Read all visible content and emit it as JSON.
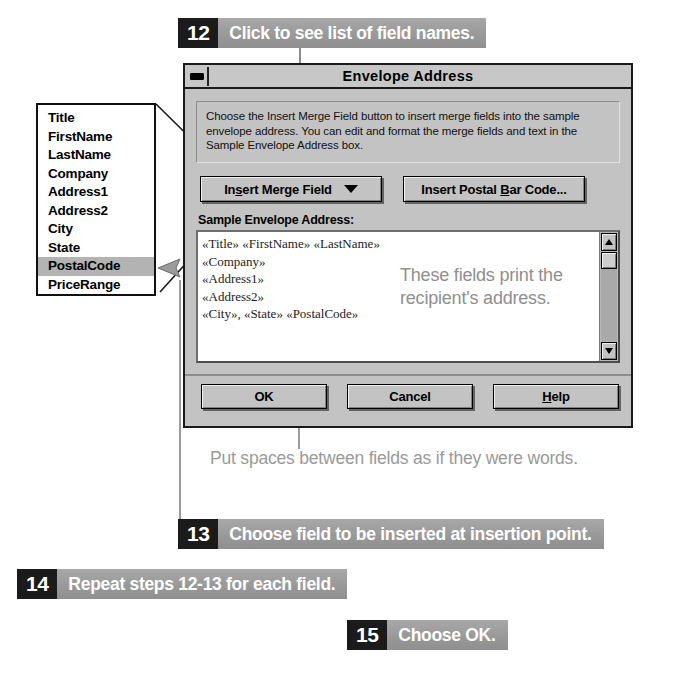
{
  "steps": [
    {
      "number": "12",
      "text": "Click to see list of field names."
    },
    {
      "number": "13",
      "text": "Choose field to be inserted at insertion point."
    },
    {
      "number": "14",
      "text": "Repeat steps 12-13 for each field."
    },
    {
      "number": "15",
      "text": "Choose OK."
    }
  ],
  "field_list": {
    "items": [
      {
        "label": "Title",
        "selected": false
      },
      {
        "label": "FirstName",
        "selected": false
      },
      {
        "label": "LastName",
        "selected": false
      },
      {
        "label": "Company",
        "selected": false
      },
      {
        "label": "Address1",
        "selected": false
      },
      {
        "label": "Address2",
        "selected": false
      },
      {
        "label": "City",
        "selected": false
      },
      {
        "label": "State",
        "selected": false
      },
      {
        "label": "PostalCode",
        "selected": true
      },
      {
        "label": "PriceRange",
        "selected": false
      }
    ],
    "selected_value": "PostalCode"
  },
  "dialog": {
    "title": "Envelope Address",
    "minimize_icon": "minimize-icon",
    "description": "Choose the Insert Merge Field button to insert merge fields into the sample envelope address.  You can edit and format the merge fields and text in the Sample Envelope Address box.",
    "buttons": {
      "insert_merge_field": {
        "label_pre": "In",
        "label_accel": "s",
        "label_post": "ert Merge Field",
        "full": "Insert Merge Field"
      },
      "insert_postal_bar_code": {
        "label_pre": "Insert Postal ",
        "label_accel": "B",
        "label_post": "ar Code...",
        "full": "Insert Postal Bar Code..."
      }
    },
    "sample_label": "Sample Envelope Address:",
    "sample_lines": [
      "«Title» «FirstName» «LastName»",
      "«Company»",
      "«Address1»",
      "«Address2»",
      "«City», «State» «PostalCode»"
    ],
    "scrollbar": {
      "up_icon": "scroll-up-arrow-icon",
      "down_icon": "scroll-down-arrow-icon"
    },
    "bottom_buttons": {
      "ok": {
        "full": "OK",
        "pre": "OK",
        "accel": "",
        "post": ""
      },
      "cancel": {
        "full": "Cancel",
        "pre": "Cancel",
        "accel": "",
        "post": ""
      },
      "help": {
        "full": "Help",
        "pre": "",
        "accel": "H",
        "post": "elp"
      }
    }
  },
  "annotations": {
    "fields_print": "These fields print the recipient's address.",
    "put_spaces": "Put spaces between fields as if they were words."
  },
  "colors": {
    "banner_number_bg": "#1b1b1b",
    "banner_bg": "#9c9c9c",
    "banner_text": "#ffffff",
    "dialog_face": "#c3c3c3",
    "dialog_border": "#1a1a1a",
    "selection_bg": "#b3b3b3",
    "annotation_gray": "#8f8f8f",
    "sample_bg": "#ffffff"
  }
}
